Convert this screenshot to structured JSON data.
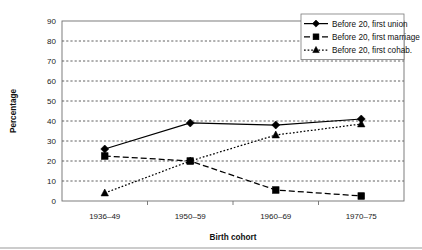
{
  "chart_data": {
    "type": "line",
    "title": "",
    "xlabel": "Birth cohort",
    "ylabel": "Percentage",
    "categories": [
      "1936–49",
      "1950–59",
      "1960–69",
      "1970–75"
    ],
    "ylim": [
      0,
      90
    ],
    "ytick_step": 10,
    "yticks": [
      "0",
      "10",
      "20",
      "30",
      "40",
      "50",
      "60",
      "70",
      "80",
      "90"
    ],
    "grid": true,
    "legend_position": "top-right",
    "series": [
      {
        "name": "Before 20, first union",
        "values": [
          26,
          39,
          38,
          41
        ],
        "marker": "diamond",
        "linestyle": "solid",
        "color": "#000000"
      },
      {
        "name": "Before 20, first marriage",
        "values": [
          22.5,
          20,
          5.5,
          2.5
        ],
        "marker": "square",
        "linestyle": "dashed",
        "color": "#000000"
      },
      {
        "name": "Before 20, first cohab.",
        "values": [
          4,
          20,
          33,
          38.5
        ],
        "marker": "triangle",
        "linestyle": "dotted",
        "color": "#000000"
      }
    ]
  },
  "legend": {
    "entries": [
      "Before 20, first union",
      "Before 20, first marriage",
      "Before 20, first cohab."
    ]
  },
  "axes": {
    "y_axis_title": "Percentage",
    "x_axis_title": "Birth cohort"
  }
}
